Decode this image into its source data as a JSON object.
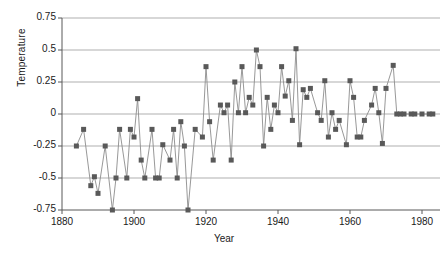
{
  "chart_data": {
    "type": "line",
    "title": "",
    "subtitle": "",
    "xlabel": "Year",
    "ylabel": "Temperature",
    "xlim": [
      1880,
      1985
    ],
    "ylim": [
      -0.75,
      0.75
    ],
    "xticks": [
      1880,
      1900,
      1920,
      1940,
      1960,
      1980
    ],
    "yticks": [
      -0.75,
      -0.5,
      -0.25,
      0,
      0.25,
      0.5,
      0.75
    ],
    "ytick_labels": [
      "-0.75",
      "-0.5",
      "-0.25",
      "0",
      "0.25",
      "0.5",
      "0.75"
    ],
    "xtick_labels": [
      "1880",
      "1900",
      "1920",
      "1940",
      "1960",
      "1980"
    ],
    "grid": "horizontal",
    "legend": "none",
    "marker": "square",
    "marker_color": "#595959",
    "line_color": "#8c8c8c",
    "grid_color": "#a6a6a6",
    "axis_color": "#595959",
    "background": "#ffffff",
    "x": [
      1884,
      1886,
      1888,
      1889,
      1890,
      1892,
      1894,
      1895,
      1896,
      1898,
      1899,
      1900,
      1901,
      1902,
      1903,
      1905,
      1906,
      1907,
      1908,
      1910,
      1911,
      1912,
      1913,
      1914,
      1915,
      1917,
      1919,
      1920,
      1921,
      1922,
      1924,
      1925,
      1926,
      1927,
      1928,
      1929,
      1930,
      1931,
      1932,
      1933,
      1934,
      1935,
      1936,
      1937,
      1938,
      1939,
      1940,
      1941,
      1942,
      1943,
      1944,
      1945,
      1946,
      1947,
      1948,
      1949,
      1951,
      1952,
      1953,
      1954,
      1955,
      1956,
      1957,
      1959,
      1960,
      1961,
      1962,
      1963,
      1964,
      1966,
      1967,
      1968,
      1969,
      1970,
      1972,
      1973,
      1974,
      1975,
      1977,
      1978,
      1980,
      1982,
      1983
    ],
    "y": [
      -0.25,
      -0.12,
      -0.56,
      -0.49,
      -0.62,
      -0.25,
      -0.75,
      -0.5,
      -0.12,
      -0.5,
      -0.12,
      -0.18,
      0.12,
      -0.36,
      -0.5,
      -0.12,
      -0.5,
      -0.5,
      -0.24,
      -0.36,
      -0.12,
      -0.5,
      -0.06,
      -0.25,
      -0.75,
      -0.12,
      -0.18,
      0.37,
      -0.06,
      -0.36,
      0.07,
      0.01,
      0.07,
      -0.36,
      0.25,
      0.01,
      0.37,
      0.01,
      0.13,
      0.07,
      0.5,
      0.37,
      -0.25,
      0.13,
      -0.12,
      0.07,
      0.01,
      0.37,
      0.14,
      0.26,
      -0.05,
      0.51,
      -0.24,
      0.19,
      0.13,
      0.2,
      0.01,
      -0.05,
      0.26,
      -0.18,
      0.01,
      -0.12,
      -0.05,
      -0.24,
      0.26,
      0.13,
      -0.18,
      -0.18,
      -0.05,
      0.07,
      0.2,
      0.01,
      -0.23,
      0.2,
      0.38,
      0.0,
      0.0,
      0.0,
      0.0,
      0.0,
      0.0,
      0.0,
      0.0
    ],
    "series_name": "Global temperature anomaly",
    "n_points": 74
  },
  "axis": {
    "ylabel_text": "Temperature",
    "xlabel_text": "Year"
  }
}
